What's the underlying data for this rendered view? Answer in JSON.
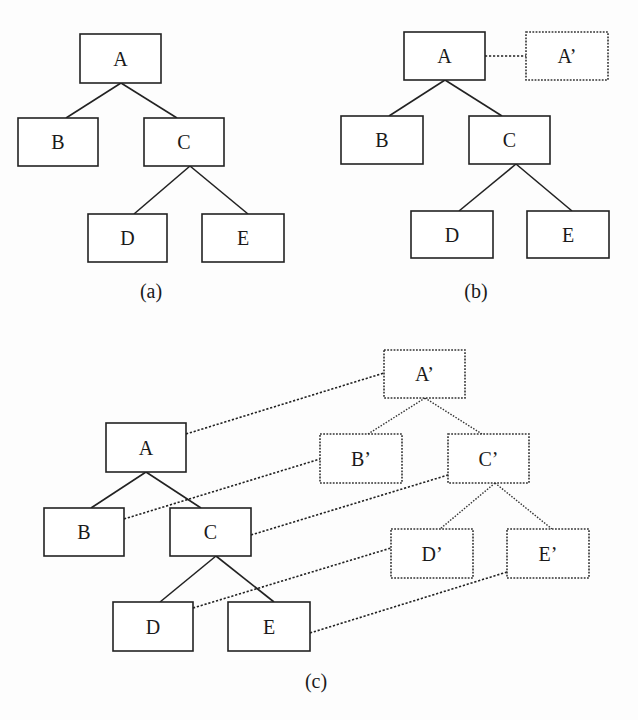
{
  "figure": {
    "width": 638,
    "height": 720,
    "colors": {
      "ink": "#222222",
      "background": "#fdfdfd"
    },
    "panels": [
      {
        "id": "a",
        "caption": "(a)",
        "caption_pos": [
          151,
          298
        ],
        "nodes": [
          {
            "id": "A",
            "label": "A",
            "x": 80,
            "y": 34,
            "w": 81,
            "h": 49,
            "style": "solid"
          },
          {
            "id": "B",
            "label": "B",
            "x": 18,
            "y": 118,
            "w": 80,
            "h": 48,
            "style": "solid"
          },
          {
            "id": "C",
            "label": "C",
            "x": 144,
            "y": 118,
            "w": 80,
            "h": 48,
            "style": "solid"
          },
          {
            "id": "D",
            "label": "D",
            "x": 88,
            "y": 214,
            "w": 79,
            "h": 48,
            "style": "solid"
          },
          {
            "id": "E",
            "label": "E",
            "x": 202,
            "y": 214,
            "w": 82,
            "h": 48,
            "style": "solid"
          }
        ],
        "edges": [
          {
            "from": [
              121,
              83
            ],
            "to": [
              66,
              118
            ],
            "style": "solid"
          },
          {
            "from": [
              121,
              83
            ],
            "to": [
              177,
              118
            ],
            "style": "solid"
          },
          {
            "from": [
              190,
              166
            ],
            "to": [
              134,
              214
            ],
            "style": "solid"
          },
          {
            "from": [
              190,
              166
            ],
            "to": [
              248,
              214
            ],
            "style": "solid"
          }
        ],
        "links": []
      },
      {
        "id": "b",
        "caption": "(b)",
        "caption_pos": [
          476,
          298
        ],
        "nodes": [
          {
            "id": "A",
            "label": "A",
            "x": 404,
            "y": 32,
            "w": 81,
            "h": 48,
            "style": "solid"
          },
          {
            "id": "A'",
            "label": "A’",
            "x": 526,
            "y": 32,
            "w": 82,
            "h": 48,
            "style": "dotted"
          },
          {
            "id": "B",
            "label": "B",
            "x": 341,
            "y": 116,
            "w": 82,
            "h": 48,
            "style": "solid"
          },
          {
            "id": "C",
            "label": "C",
            "x": 469,
            "y": 116,
            "w": 81,
            "h": 48,
            "style": "solid"
          },
          {
            "id": "D",
            "label": "D",
            "x": 411,
            "y": 211,
            "w": 82,
            "h": 47,
            "style": "solid"
          },
          {
            "id": "E",
            "label": "E",
            "x": 527,
            "y": 211,
            "w": 82,
            "h": 47,
            "style": "solid"
          }
        ],
        "edges": [
          {
            "from": [
              445,
              80
            ],
            "to": [
              389,
              116
            ],
            "style": "solid"
          },
          {
            "from": [
              445,
              80
            ],
            "to": [
              502,
              116
            ],
            "style": "solid"
          },
          {
            "from": [
              516,
              164
            ],
            "to": [
              459,
              211
            ],
            "style": "solid"
          },
          {
            "from": [
              516,
              164
            ],
            "to": [
              572,
              211
            ],
            "style": "solid"
          }
        ],
        "links": [
          {
            "from": [
              485,
              56
            ],
            "to": [
              526,
              56
            ]
          }
        ]
      },
      {
        "id": "c",
        "caption": "(c)",
        "caption_pos": [
          316,
          688
        ],
        "nodes": [
          {
            "id": "A'",
            "label": "A’",
            "x": 384,
            "y": 350,
            "w": 81,
            "h": 48,
            "style": "dotted"
          },
          {
            "id": "A",
            "label": "A",
            "x": 106,
            "y": 423,
            "w": 80,
            "h": 49,
            "style": "solid"
          },
          {
            "id": "B'",
            "label": "B’",
            "x": 320,
            "y": 434,
            "w": 82,
            "h": 49,
            "style": "dotted"
          },
          {
            "id": "C'",
            "label": "C’",
            "x": 448,
            "y": 434,
            "w": 81,
            "h": 49,
            "style": "dotted"
          },
          {
            "id": "B",
            "label": "B",
            "x": 44,
            "y": 508,
            "w": 80,
            "h": 48,
            "style": "solid"
          },
          {
            "id": "C",
            "label": "C",
            "x": 170,
            "y": 508,
            "w": 81,
            "h": 48,
            "style": "solid"
          },
          {
            "id": "D'",
            "label": "D’",
            "x": 391,
            "y": 529,
            "w": 82,
            "h": 49,
            "style": "dotted"
          },
          {
            "id": "E'",
            "label": "E’",
            "x": 507,
            "y": 529,
            "w": 82,
            "h": 49,
            "style": "dotted"
          },
          {
            "id": "D",
            "label": "D",
            "x": 113,
            "y": 602,
            "w": 80,
            "h": 49,
            "style": "solid"
          },
          {
            "id": "E",
            "label": "E",
            "x": 228,
            "y": 602,
            "w": 82,
            "h": 49,
            "style": "solid"
          }
        ],
        "edges": [
          {
            "from": [
              146,
              472
            ],
            "to": [
              91,
              508
            ],
            "style": "solid"
          },
          {
            "from": [
              146,
              472
            ],
            "to": [
              201,
              508
            ],
            "style": "solid"
          },
          {
            "from": [
              216,
              556
            ],
            "to": [
              160,
              602
            ],
            "style": "solid"
          },
          {
            "from": [
              216,
              556
            ],
            "to": [
              274,
              602
            ],
            "style": "solid"
          },
          {
            "from": [
              425,
              398
            ],
            "to": [
              368,
              434
            ],
            "style": "dotted"
          },
          {
            "from": [
              425,
              398
            ],
            "to": [
              482,
              434
            ],
            "style": "dotted"
          },
          {
            "from": [
              495,
              483
            ],
            "to": [
              440,
              529
            ],
            "style": "dotted"
          },
          {
            "from": [
              495,
              483
            ],
            "to": [
              552,
              529
            ],
            "style": "dotted"
          }
        ],
        "links": [
          {
            "from": [
              186,
              434
            ],
            "to": [
              384,
              373
            ]
          },
          {
            "from": [
              124,
              519
            ],
            "to": [
              320,
              459
            ]
          },
          {
            "from": [
              251,
              535
            ],
            "to": [
              448,
              475
            ]
          },
          {
            "from": [
              193,
              608
            ],
            "to": [
              391,
              548
            ]
          },
          {
            "from": [
              310,
              633
            ],
            "to": [
              507,
              572
            ]
          }
        ]
      }
    ]
  }
}
